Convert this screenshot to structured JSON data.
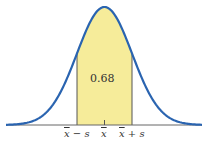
{
  "chart_data": {
    "type": "area",
    "title": "",
    "xlabel": "",
    "ylabel": "",
    "shaded_area_label": "0.68",
    "tick_labels": [
      "x̄ − s",
      "x̄",
      "x̄ + s"
    ],
    "x": [
      -3,
      -2,
      -1,
      0,
      1,
      2,
      3
    ],
    "values": [
      0.004,
      0.054,
      0.242,
      0.399,
      0.242,
      0.054,
      0.004
    ],
    "shaded_range": [
      -1,
      1
    ],
    "grid": false,
    "legend": "none",
    "colors": {
      "curve": "#2a64b0",
      "fill": "#f6ec9a",
      "axis": "#666666"
    }
  },
  "labels": {
    "area": "0.68",
    "left_tick_sym": "x",
    "left_tick_rest": " − s",
    "mid_tick_sym": "x",
    "right_tick_sym": "x",
    "right_tick_rest": " + s"
  }
}
